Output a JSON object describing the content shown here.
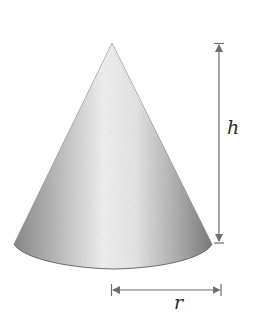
{
  "figure": {
    "shape": "right circular cone",
    "labels": {
      "height": "h",
      "radius": "r"
    },
    "dimensions": [
      {
        "name": "height",
        "symbol": "h",
        "orientation": "vertical",
        "arrow": "double-headed"
      },
      {
        "name": "radius",
        "symbol": "r",
        "orientation": "horizontal",
        "arrow": "double-headed"
      }
    ],
    "colors": {
      "cone_light": "#f4f4f4",
      "cone_mid": "#bdbdbd",
      "cone_dark": "#7a7a7a",
      "arrow": "#6e6e6e",
      "text": "#2a2a2a"
    }
  }
}
